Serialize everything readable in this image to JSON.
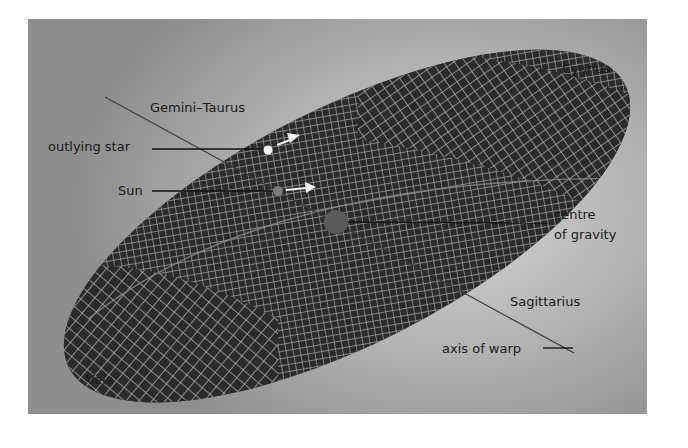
{
  "diagram": {
    "labels": {
      "gemini_taurus": "Gemini–Taurus",
      "outlying_star": "outlying star",
      "sun": "Sun",
      "centre_line1": "centre",
      "centre_line2": "of gravity",
      "cygnus": "Cygnus",
      "sagittarius": "Sagittarius",
      "axis_of_warp": "axis of warp",
      "vela": "Vela"
    },
    "colors": {
      "disc": "#2b2b2b",
      "grid": "#a8a8a8",
      "background_light": "#d4d4d4",
      "background_dark": "#8e8e8e",
      "outlying_star": "#f2f2f2",
      "sun": "#7a7a7a",
      "centre_of_gravity": "#5a5a5a",
      "text": "#1a1a1a"
    }
  }
}
